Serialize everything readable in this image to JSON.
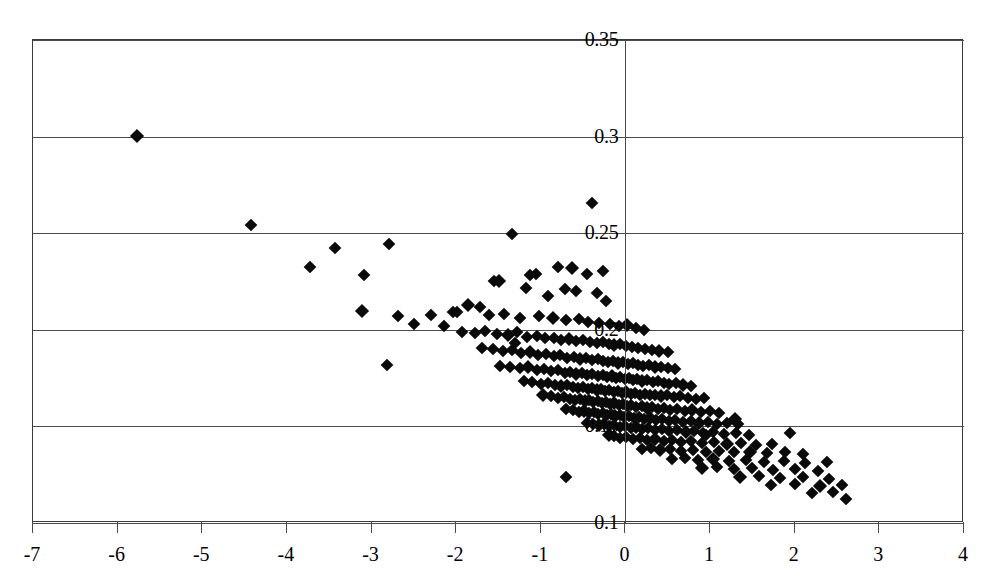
{
  "chart_data": {
    "type": "scatter",
    "title": "",
    "subtitle": "",
    "xlabel": "",
    "ylabel": "",
    "xlim": [
      -7,
      4
    ],
    "ylim": [
      0.1,
      0.35
    ],
    "grid": "horizontal gridlines at every y tick; vertical axis line at x = 0",
    "legend": "none",
    "marker": "filled black diamond",
    "x_ticks": [
      -7,
      -6,
      -5,
      -4,
      -3,
      -2,
      -1,
      0,
      1,
      2,
      3,
      4
    ],
    "x_tick_labels": [
      "-7",
      "-6",
      "-5",
      "-4",
      "-3",
      "-2",
      "-1",
      "0",
      "1",
      "2",
      "3",
      "4"
    ],
    "y_ticks": [
      0.1,
      0.15,
      0.2,
      0.25,
      0.3,
      0.35
    ],
    "y_tick_labels": [
      "0.1",
      "0.15",
      "0.2",
      "0.25",
      "0.3",
      "0.35"
    ],
    "point_count": 300,
    "points": [
      [
        -5.77,
        0.3005
      ],
      [
        -4.42,
        0.2545
      ],
      [
        -3.43,
        0.2425
      ],
      [
        -2.79,
        0.2445
      ],
      [
        -3.73,
        0.2325
      ],
      [
        -3.09,
        0.2285
      ],
      [
        -2.82,
        0.182
      ],
      [
        -3.11,
        0.2095
      ],
      [
        -2.69,
        0.207
      ],
      [
        -2.3,
        0.2075
      ],
      [
        -2.14,
        0.202
      ],
      [
        -1.99,
        0.209
      ],
      [
        -1.34,
        0.2495
      ],
      [
        -0.4,
        0.2655
      ],
      [
        -0.63,
        0.232
      ],
      [
        -0.8,
        0.2325
      ],
      [
        -1.06,
        0.229
      ],
      [
        -1.13,
        0.2285
      ],
      [
        -0.46,
        0.229
      ],
      [
        -0.27,
        0.2305
      ],
      [
        -1.55,
        0.2255
      ],
      [
        -1.5,
        0.2255
      ],
      [
        -1.18,
        0.2215
      ],
      [
        -0.92,
        0.2175
      ],
      [
        -0.72,
        0.221
      ],
      [
        -0.58,
        0.22
      ],
      [
        -0.34,
        0.219
      ],
      [
        -0.23,
        0.215
      ],
      [
        -1.86,
        0.213
      ],
      [
        -1.72,
        0.212
      ],
      [
        -2.04,
        0.209
      ],
      [
        -1.61,
        0.2075
      ],
      [
        -1.44,
        0.208
      ],
      [
        -1.25,
        0.206
      ],
      [
        -1.02,
        0.207
      ],
      [
        -0.86,
        0.206
      ],
      [
        -0.7,
        0.205
      ],
      [
        -0.55,
        0.2055
      ],
      [
        -0.44,
        0.204
      ],
      [
        -0.31,
        0.2035
      ],
      [
        -0.18,
        0.203
      ],
      [
        -0.08,
        0.202
      ],
      [
        0.02,
        0.2025
      ],
      [
        0.12,
        0.201
      ],
      [
        0.22,
        0.2
      ],
      [
        -1.93,
        0.199
      ],
      [
        -1.78,
        0.1985
      ],
      [
        -1.66,
        0.1995
      ],
      [
        -1.52,
        0.198
      ],
      [
        -1.39,
        0.1975
      ],
      [
        -1.28,
        0.199
      ],
      [
        -1.16,
        0.1965
      ],
      [
        -1.05,
        0.197
      ],
      [
        -0.95,
        0.1955
      ],
      [
        -0.85,
        0.196
      ],
      [
        -0.76,
        0.1945
      ],
      [
        -0.67,
        0.195
      ],
      [
        -0.58,
        0.194
      ],
      [
        -0.5,
        0.1945
      ],
      [
        -0.42,
        0.1935
      ],
      [
        -0.34,
        0.193
      ],
      [
        -0.27,
        0.1935
      ],
      [
        -0.2,
        0.1925
      ],
      [
        -0.13,
        0.192
      ],
      [
        -0.06,
        0.1925
      ],
      [
        0.01,
        0.1915
      ],
      [
        0.08,
        0.191
      ],
      [
        0.15,
        0.1905
      ],
      [
        0.23,
        0.19
      ],
      [
        0.31,
        0.1895
      ],
      [
        0.4,
        0.189
      ],
      [
        0.5,
        0.1885
      ],
      [
        -1.7,
        0.1905
      ],
      [
        -1.57,
        0.19
      ],
      [
        -1.45,
        0.189
      ],
      [
        -1.34,
        0.1895
      ],
      [
        -1.23,
        0.188
      ],
      [
        -1.13,
        0.1885
      ],
      [
        -1.03,
        0.187
      ],
      [
        -0.94,
        0.1875
      ],
      [
        -0.85,
        0.1865
      ],
      [
        -0.77,
        0.187
      ],
      [
        -0.69,
        0.1855
      ],
      [
        -0.61,
        0.186
      ],
      [
        -0.54,
        0.185
      ],
      [
        -0.47,
        0.1855
      ],
      [
        -0.4,
        0.1845
      ],
      [
        -0.33,
        0.185
      ],
      [
        -0.27,
        0.184
      ],
      [
        -0.21,
        0.1835
      ],
      [
        -0.15,
        0.184
      ],
      [
        -0.09,
        0.183
      ],
      [
        -0.03,
        0.1835
      ],
      [
        0.03,
        0.1825
      ],
      [
        0.09,
        0.183
      ],
      [
        0.15,
        0.182
      ],
      [
        0.21,
        0.1815
      ],
      [
        0.28,
        0.182
      ],
      [
        0.35,
        0.181
      ],
      [
        0.42,
        0.1805
      ],
      [
        0.5,
        0.18
      ],
      [
        0.58,
        0.1795
      ],
      [
        -1.48,
        0.1815
      ],
      [
        -1.36,
        0.181
      ],
      [
        -1.25,
        0.18
      ],
      [
        -1.15,
        0.1805
      ],
      [
        -1.05,
        0.179
      ],
      [
        -0.96,
        0.1795
      ],
      [
        -0.88,
        0.1785
      ],
      [
        -0.8,
        0.179
      ],
      [
        -0.72,
        0.1775
      ],
      [
        -0.65,
        0.178
      ],
      [
        -0.58,
        0.177
      ],
      [
        -0.51,
        0.1775
      ],
      [
        -0.45,
        0.1765
      ],
      [
        -0.39,
        0.177
      ],
      [
        -0.33,
        0.176
      ],
      [
        -0.27,
        0.1765
      ],
      [
        -0.22,
        0.1755
      ],
      [
        -0.16,
        0.176
      ],
      [
        -0.11,
        0.175
      ],
      [
        -0.06,
        0.1755
      ],
      [
        -0.01,
        0.1745
      ],
      [
        0.04,
        0.175
      ],
      [
        0.09,
        0.174
      ],
      [
        0.14,
        0.1745
      ],
      [
        0.2,
        0.1735
      ],
      [
        0.26,
        0.174
      ],
      [
        0.32,
        0.173
      ],
      [
        0.38,
        0.1735
      ],
      [
        0.45,
        0.1725
      ],
      [
        0.52,
        0.172
      ],
      [
        0.6,
        0.1725
      ],
      [
        0.68,
        0.1715
      ],
      [
        0.77,
        0.171
      ],
      [
        -1.2,
        0.1735
      ],
      [
        -1.1,
        0.173
      ],
      [
        -1.0,
        0.172
      ],
      [
        -0.91,
        0.1725
      ],
      [
        -0.83,
        0.1715
      ],
      [
        -0.76,
        0.171
      ],
      [
        -0.69,
        0.1715
      ],
      [
        -0.62,
        0.1705
      ],
      [
        -0.56,
        0.17
      ],
      [
        -0.5,
        0.1705
      ],
      [
        -0.44,
        0.1695
      ],
      [
        -0.39,
        0.17
      ],
      [
        -0.34,
        0.169
      ],
      [
        -0.29,
        0.1695
      ],
      [
        -0.24,
        0.1685
      ],
      [
        -0.19,
        0.169
      ],
      [
        -0.14,
        0.168
      ],
      [
        -0.09,
        0.1685
      ],
      [
        -0.04,
        0.1675
      ],
      [
        0.01,
        0.168
      ],
      [
        0.06,
        0.167
      ],
      [
        0.11,
        0.1675
      ],
      [
        0.17,
        0.1665
      ],
      [
        0.23,
        0.167
      ],
      [
        0.29,
        0.166
      ],
      [
        0.35,
        0.1665
      ],
      [
        0.42,
        0.1655
      ],
      [
        0.49,
        0.166
      ],
      [
        0.57,
        0.165
      ],
      [
        0.65,
        0.1655
      ],
      [
        0.74,
        0.1645
      ],
      [
        0.83,
        0.164
      ],
      [
        0.93,
        0.1645
      ],
      [
        -0.97,
        0.166
      ],
      [
        -0.88,
        0.1655
      ],
      [
        -0.8,
        0.1645
      ],
      [
        -0.73,
        0.165
      ],
      [
        -0.66,
        0.164
      ],
      [
        -0.6,
        0.1635
      ],
      [
        -0.54,
        0.164
      ],
      [
        -0.48,
        0.163
      ],
      [
        -0.43,
        0.1635
      ],
      [
        -0.38,
        0.1625
      ],
      [
        -0.33,
        0.163
      ],
      [
        -0.28,
        0.162
      ],
      [
        -0.23,
        0.1625
      ],
      [
        -0.18,
        0.1615
      ],
      [
        -0.13,
        0.162
      ],
      [
        -0.08,
        0.161
      ],
      [
        -0.03,
        0.1615
      ],
      [
        0.02,
        0.1605
      ],
      [
        0.07,
        0.161
      ],
      [
        0.13,
        0.16
      ],
      [
        0.19,
        0.1605
      ],
      [
        0.25,
        0.1595
      ],
      [
        0.31,
        0.16
      ],
      [
        0.38,
        0.159
      ],
      [
        0.45,
        0.1595
      ],
      [
        0.53,
        0.1585
      ],
      [
        0.61,
        0.159
      ],
      [
        0.7,
        0.158
      ],
      [
        0.79,
        0.1585
      ],
      [
        0.89,
        0.1575
      ],
      [
        1.0,
        0.158
      ],
      [
        1.11,
        0.157
      ],
      [
        -0.7,
        0.159
      ],
      [
        -0.62,
        0.1585
      ],
      [
        -0.55,
        0.1575
      ],
      [
        -0.49,
        0.158
      ],
      [
        -0.43,
        0.157
      ],
      [
        -0.37,
        0.1575
      ],
      [
        -0.32,
        0.1565
      ],
      [
        -0.27,
        0.157
      ],
      [
        -0.22,
        0.156
      ],
      [
        -0.17,
        0.1565
      ],
      [
        -0.12,
        0.1555
      ],
      [
        -0.07,
        0.156
      ],
      [
        -0.02,
        0.155
      ],
      [
        0.04,
        0.1555
      ],
      [
        0.1,
        0.1545
      ],
      [
        0.16,
        0.155
      ],
      [
        0.22,
        0.154
      ],
      [
        0.29,
        0.1545
      ],
      [
        0.36,
        0.1535
      ],
      [
        0.43,
        0.154
      ],
      [
        0.51,
        0.153
      ],
      [
        0.59,
        0.1535
      ],
      [
        0.68,
        0.1525
      ],
      [
        0.77,
        0.153
      ],
      [
        0.87,
        0.152
      ],
      [
        0.97,
        0.1525
      ],
      [
        1.08,
        0.1515
      ],
      [
        1.2,
        0.152
      ],
      [
        1.33,
        0.151
      ],
      [
        -0.45,
        0.152
      ],
      [
        -0.38,
        0.1515
      ],
      [
        -0.31,
        0.1505
      ],
      [
        -0.25,
        0.151
      ],
      [
        -0.19,
        0.15
      ],
      [
        -0.13,
        0.1505
      ],
      [
        -0.07,
        0.1495
      ],
      [
        -0.01,
        0.15
      ],
      [
        0.06,
        0.149
      ],
      [
        0.13,
        0.1495
      ],
      [
        0.2,
        0.1485
      ],
      [
        0.27,
        0.149
      ],
      [
        0.35,
        0.148
      ],
      [
        0.43,
        0.1485
      ],
      [
        0.52,
        0.1475
      ],
      [
        0.61,
        0.148
      ],
      [
        0.71,
        0.147
      ],
      [
        0.81,
        0.1475
      ],
      [
        0.92,
        0.1465
      ],
      [
        1.04,
        0.147
      ],
      [
        1.17,
        0.146
      ],
      [
        1.31,
        0.1465
      ],
      [
        1.46,
        0.1455
      ],
      [
        -0.2,
        0.1455
      ],
      [
        -0.13,
        0.145
      ],
      [
        -0.06,
        0.144
      ],
      [
        0.01,
        0.1445
      ],
      [
        0.09,
        0.1435
      ],
      [
        0.17,
        0.144
      ],
      [
        0.26,
        0.143
      ],
      [
        0.35,
        0.1435
      ],
      [
        0.45,
        0.1425
      ],
      [
        0.55,
        0.143
      ],
      [
        0.66,
        0.142
      ],
      [
        0.78,
        0.1425
      ],
      [
        0.91,
        0.1415
      ],
      [
        1.05,
        0.142
      ],
      [
        1.2,
        0.141
      ],
      [
        1.36,
        0.1415
      ],
      [
        1.54,
        0.1405
      ],
      [
        1.73,
        0.141
      ],
      [
        1.95,
        0.1465
      ],
      [
        0.2,
        0.1385
      ],
      [
        0.3,
        0.139
      ],
      [
        0.41,
        0.138
      ],
      [
        0.53,
        0.1385
      ],
      [
        0.66,
        0.1375
      ],
      [
        0.8,
        0.138
      ],
      [
        0.95,
        0.137
      ],
      [
        1.11,
        0.1375
      ],
      [
        1.28,
        0.1365
      ],
      [
        1.47,
        0.137
      ],
      [
        1.67,
        0.136
      ],
      [
        1.88,
        0.1365
      ],
      [
        2.1,
        0.1355
      ],
      [
        0.55,
        0.133
      ],
      [
        0.7,
        0.1335
      ],
      [
        0.86,
        0.1325
      ],
      [
        1.03,
        0.133
      ],
      [
        1.22,
        0.132
      ],
      [
        1.42,
        0.1325
      ],
      [
        1.64,
        0.1315
      ],
      [
        1.87,
        0.132
      ],
      [
        2.12,
        0.131
      ],
      [
        2.38,
        0.1315
      ],
      [
        0.9,
        0.1285
      ],
      [
        1.08,
        0.129
      ],
      [
        1.28,
        0.128
      ],
      [
        1.5,
        0.1285
      ],
      [
        1.74,
        0.1275
      ],
      [
        2.0,
        0.128
      ],
      [
        2.28,
        0.127
      ],
      [
        1.35,
        0.124
      ],
      [
        1.58,
        0.1245
      ],
      [
        1.83,
        0.1235
      ],
      [
        2.1,
        0.124
      ],
      [
        2.4,
        0.123
      ],
      [
        1.72,
        0.1195
      ],
      [
        2.0,
        0.12
      ],
      [
        2.3,
        0.119
      ],
      [
        2.56,
        0.1195
      ],
      [
        2.2,
        0.1155
      ],
      [
        2.45,
        0.116
      ],
      [
        2.6,
        0.1125
      ],
      [
        -0.7,
        0.124
      ],
      [
        0.95,
        0.1455
      ],
      [
        1.3,
        0.154
      ],
      [
        -1.3,
        0.193
      ],
      [
        -2.5,
        0.203
      ]
    ]
  }
}
